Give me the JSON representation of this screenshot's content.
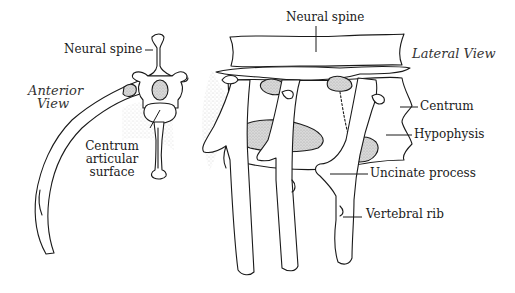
{
  "figure": {
    "type": "anatomical-line-drawing",
    "views": [
      {
        "name": "Anterior View",
        "labels": [
          {
            "text": "Neural spine",
            "target": "neural-spine"
          },
          {
            "text": "Centrum articular surface",
            "lines": [
              "Centrum",
              "articular",
              "surface"
            ],
            "target": "centrum-articular-surface"
          }
        ]
      },
      {
        "name": "Lateral View",
        "labels": [
          {
            "text": "Neural spine",
            "target": "neural-spine"
          },
          {
            "text": "Centrum",
            "target": "centrum"
          },
          {
            "text": "Hypophysis",
            "target": "hypophysis"
          },
          {
            "text": "Uncinate process",
            "target": "uncinate-process"
          },
          {
            "text": "Vertebral rib",
            "target": "vertebral-rib"
          }
        ]
      }
    ]
  },
  "labels": {
    "anterior_view_line1": "Anterior",
    "anterior_view_line2": "View",
    "lateral_view": "Lateral View",
    "anterior_neural_spine": "Neural spine",
    "centrum_articular_1": "Centrum",
    "centrum_articular_2": "articular",
    "centrum_articular_3": "surface",
    "lateral_neural_spine": "Neural spine",
    "centrum": "Centrum",
    "hypophysis": "Hypophysis",
    "uncinate_process": "Uncinate process",
    "vertebral_rib": "Vertebral rib"
  }
}
